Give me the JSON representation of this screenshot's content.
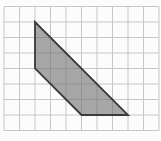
{
  "diagram": {
    "background_color": "#fcfcfc",
    "grid": {
      "cols": 10,
      "rows": 8,
      "cell_px": 15.5,
      "origin_x": 4,
      "origin_y": 6.5,
      "line_color": "#c7c7c7",
      "line_width": 1
    },
    "polygon": {
      "vertices_grid": [
        [
          2,
          1
        ],
        [
          2,
          4
        ],
        [
          5,
          7
        ],
        [
          8,
          7
        ]
      ],
      "fill_color": "rgba(110,110,110,0.6)",
      "stroke_color": "#3b3b3b",
      "stroke_width": 1.8
    }
  }
}
